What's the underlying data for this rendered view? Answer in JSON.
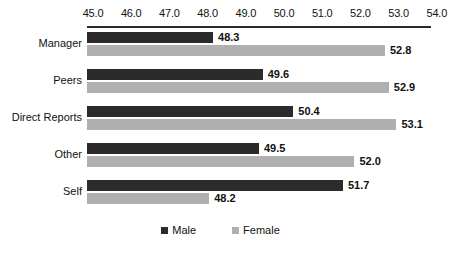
{
  "chart_data": {
    "type": "bar",
    "orientation": "horizontal",
    "title": "",
    "xlabel": "",
    "ylabel": "",
    "categories": [
      "Manager",
      "Peers",
      "Direct Reports",
      "Other",
      "Self"
    ],
    "series": [
      {
        "name": "Male",
        "color": "#2b2b2b",
        "values": [
          48.3,
          49.6,
          50.4,
          49.5,
          51.7
        ]
      },
      {
        "name": "Female",
        "color": "#b0b0b0",
        "values": [
          52.8,
          52.9,
          53.1,
          52.0,
          48.2
        ]
      }
    ],
    "xlim": [
      45.0,
      54.0
    ],
    "xticks": [
      45.0,
      46.0,
      47.0,
      48.0,
      49.0,
      50.0,
      51.0,
      52.0,
      53.0,
      54.0
    ],
    "xtick_labels": [
      "45.0",
      "46.0",
      "47.0",
      "48.0",
      "49.0",
      "50.0",
      "51.0",
      "52.0",
      "53.0",
      "54.0"
    ],
    "data_labels": [
      [
        "48.3",
        "52.8"
      ],
      [
        "49.6",
        "52.9"
      ],
      [
        "50.4",
        "53.1"
      ],
      [
        "49.5",
        "52.0"
      ],
      [
        "51.7",
        "48.2"
      ]
    ],
    "grid": false,
    "axis_position": "top",
    "legend_position": "bottom-center",
    "legend_entries": [
      "Male",
      "Female"
    ]
  },
  "axis": {
    "min": 45.0,
    "max": 54.0,
    "step": 1.0
  },
  "geometry": {
    "plot_left_px": 87,
    "value_at_left_px": 45.0,
    "px_per_unit": 38.2,
    "group_height_px": 37,
    "group_top_px": 2
  }
}
